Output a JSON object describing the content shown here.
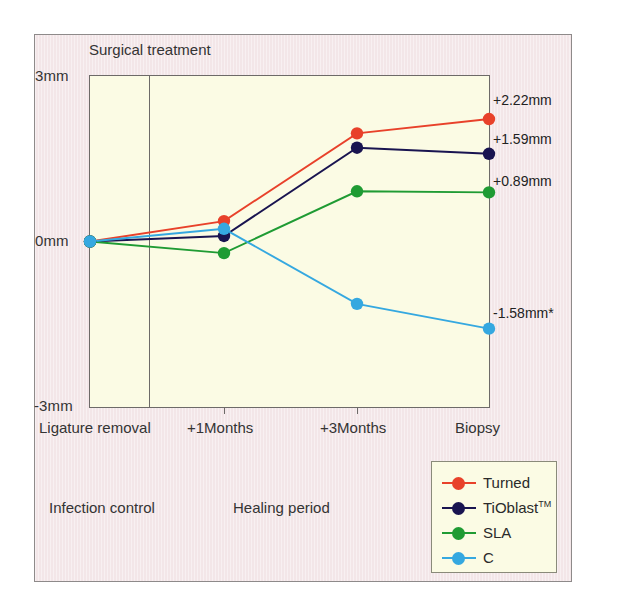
{
  "figure": {
    "plot_caption": "Surgical treatment",
    "phase_labels": [
      {
        "text": "Infection control"
      },
      {
        "text": "Healing period"
      }
    ]
  },
  "chart_data": {
    "type": "line",
    "title": "Surgical treatment",
    "xlabel": "",
    "ylabel": "",
    "categories": [
      "Ligature removal",
      "+1Months",
      "+3Months",
      "Biopsy"
    ],
    "ylim": [
      -3,
      3
    ],
    "y_ticks": [
      "3mm",
      "0mm",
      "-3mm"
    ],
    "y_tick_values": [
      3,
      0,
      -3
    ],
    "grid": false,
    "legend_position": "bottom-right",
    "series": [
      {
        "name": "Turned",
        "color": "#e8412a",
        "values": [
          0,
          0.37,
          1.96,
          2.22
        ],
        "end_label": "+2.22mm"
      },
      {
        "name": "TiOblast",
        "name_sup": "TM",
        "color": "#191450",
        "values": [
          0,
          0.1,
          1.7,
          1.59
        ],
        "end_label": "+1.59mm"
      },
      {
        "name": "SLA",
        "color": "#1f9b33",
        "values": [
          0,
          -0.21,
          0.91,
          0.89
        ],
        "end_label": "+0.89mm"
      },
      {
        "name": "C",
        "color": "#35a8e0",
        "values": [
          0,
          0.23,
          -1.13,
          -1.58
        ],
        "end_label": "-1.58mm*"
      }
    ]
  }
}
